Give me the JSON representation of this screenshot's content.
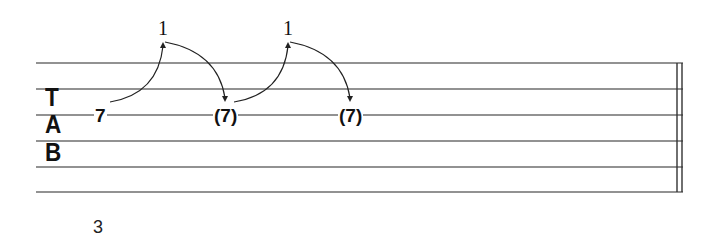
{
  "tablature": {
    "clef": {
      "letters": [
        "T",
        "A",
        "B"
      ]
    },
    "staff": {
      "lines": 6,
      "line_color": "#6e6e6e",
      "ink_color": "#111111"
    },
    "notes": [
      {
        "label": "7",
        "string": 2,
        "parenthesized": false
      },
      {
        "label": "7",
        "string": 2,
        "parenthesized": true,
        "display": "(7)"
      },
      {
        "label": "7",
        "string": 2,
        "parenthesized": true,
        "display": "(7)"
      }
    ],
    "bends": [
      {
        "amount": "1",
        "type": "bend-release"
      },
      {
        "amount": "1",
        "type": "bend-release"
      }
    ],
    "barline": "final-double",
    "measure_number": "3"
  }
}
